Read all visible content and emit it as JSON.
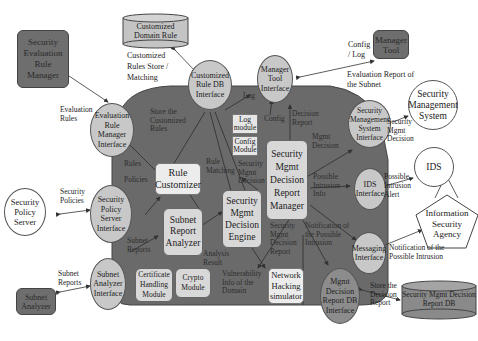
{
  "external": {
    "security_evaluation_rule_manager": "Security Evaluation Rule Manager",
    "customized_domain_rule_db": "Customized Domain Rule",
    "manager_tool": "Manager Tool",
    "security_management_system": "Security Management System",
    "ids": "IDS",
    "information_security_agency": "Information Security Agency",
    "security_policy_server": "Security Policy Server",
    "subnet_analyzer": "Subnet Analyzer",
    "security_mgmt_decision_report_db": "Security Mgmt Decision Report DB"
  },
  "interfaces": {
    "evaluation_rule_manager_interface": "Evaluation Rule Manager Interface",
    "customized_rule_db_interface": "Customized Rule DB Interface",
    "manager_tool_interface": "Manager Tool Interface",
    "security_management_system_interface": "Security Management System Interface",
    "ids_interface": "IDS Interface",
    "messaging_interface": "Messaging Interface",
    "security_policy_server_interface": "Security Policy Server Interface",
    "subnet_analyzer_interface": "Subnet Analyzer Interface",
    "mgmt_decision_report_db_interface": "Mgmt Decision Report DB Interface"
  },
  "modules": {
    "rule_customizer": "Rule Customizer",
    "subnet_report_analyzer": "Subnet Report Analyzer",
    "security_mgmt_decision_engine": "Security Mgmt Decision Engine",
    "security_mgmt_decision_report_manager": "Security Mgmt Decision Report Manager",
    "log_module": "Log module",
    "config_module": "Config Module",
    "certificate_handling_module": "Certificate Handling Module",
    "crypto_module": "Crypto Module",
    "network_hacking_simulator": "Network Hacking simulator"
  },
  "edge_labels": {
    "evaluation_rules": "Evaluation Rules",
    "customized_rules_store_matching": "Customized Rules Store / Matching",
    "config_log": "Config / Log",
    "evaluation_report_of_subnet": "Evaluation Report of the Subnet",
    "security_mgmt_decision_out": "Security Mgmt Decision",
    "possible_intrusion_alert": "Possible Intrusion Alert",
    "notification_possible_intrusion_out": "Notification of the Possible Intrusion",
    "store_decision_report": "Store the Decision Report",
    "security_policies": "Security Policies",
    "subnet_reports_out": "Subnet Reports",
    "store_customized_rules": "Store the Customized Rules",
    "rules": "Rules",
    "policies": "Policies",
    "rule_matching": "Rule Matching",
    "log": "Log",
    "config": "Config",
    "decision_report": "Decision Report",
    "mgmt_decision": "Mgmt Decision",
    "security_mgmt_decision_in": "Security Mgmt Decision",
    "possible_intrusion_info": "Possible Intrusion Info",
    "subnet_reports_in": "Subnet Reports",
    "analysis_result": "Analysis Result",
    "vulnerability_info": "Vulnerability Info of the Domain",
    "security_mgmt_decision_report": "Security Mgmt Decision Report",
    "notification_possible_intrusion_in": "Notification of the Possible Intrusion"
  },
  "colors": {
    "core_region": "#6a6a6a",
    "interface_fill": "#c8c8c8",
    "external_dark": "#6e6e6e",
    "module_light": "#d8d8d8"
  }
}
